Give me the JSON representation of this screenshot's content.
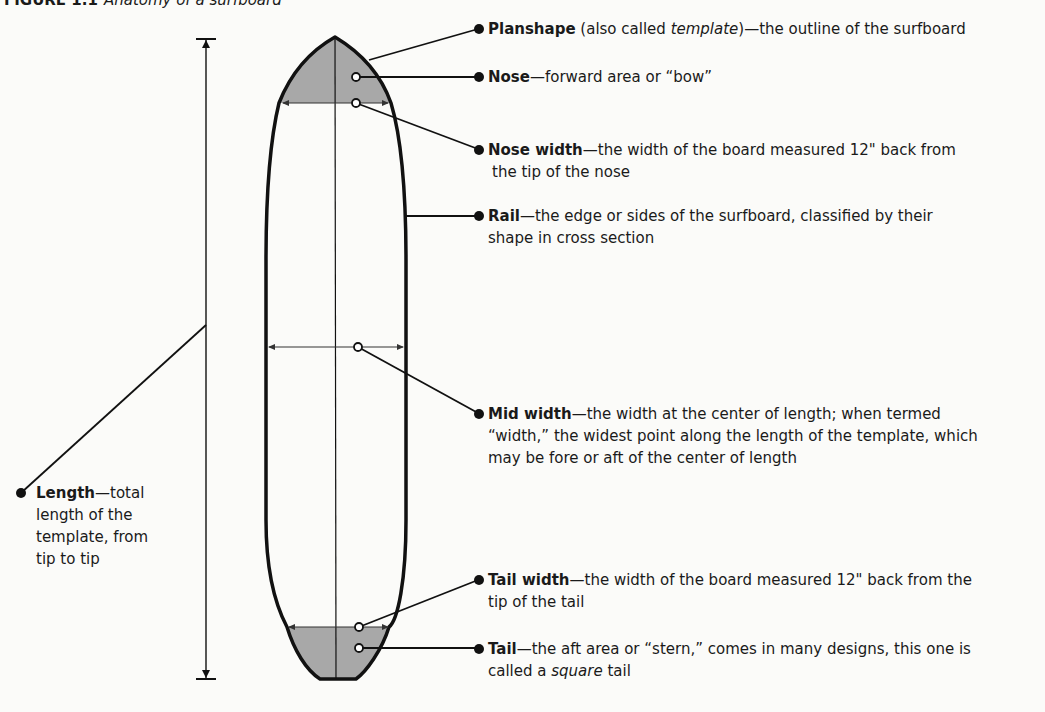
{
  "figure": {
    "number": "FIGURE 1.1",
    "caption": "Anatomy of a surfboard"
  },
  "colors": {
    "outline": "#111111",
    "shading": "#a8a8a8",
    "background": "#fbfbf9"
  },
  "labels": {
    "planshape": {
      "term": "Planshape",
      "pre": " (also called ",
      "italic": "template",
      "post": ")—the outline of the surfboard"
    },
    "nose": {
      "term": "Nose",
      "desc": "—forward area or “bow”"
    },
    "nose_width": {
      "term": "Nose width",
      "desc": "—the width of the board measured 12\" back from",
      "desc2": "the tip of the nose"
    },
    "rail": {
      "term": "Rail",
      "desc": "—the edge or sides of the surfboard, classified by their",
      "desc2": "shape in cross section"
    },
    "mid_width": {
      "term": "Mid width",
      "desc": "—the width at the center of length; when termed",
      "desc2": "“width,” the widest point along the length of the template, which",
      "desc3": "may be fore or aft of the center of length"
    },
    "length": {
      "term": "Length",
      "desc": "—total",
      "desc2": "length of the",
      "desc3": "template, from",
      "desc4": "tip to tip"
    },
    "tail_width": {
      "term": "Tail width",
      "desc": "—the width of the board measured 12\" back from the",
      "desc2": "tip of the tail"
    },
    "tail": {
      "term": "Tail",
      "desc": "—the aft area or “stern,” comes in many designs, this one is",
      "pre2": "called a ",
      "italic2": "square",
      "post2": " tail"
    }
  }
}
